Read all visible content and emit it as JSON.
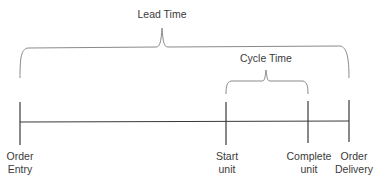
{
  "diagram": {
    "braces": [
      {
        "id": "lead-time",
        "label": "Lead Time",
        "from": "Order Entry",
        "to": "Order Delivery"
      },
      {
        "id": "cycle-time",
        "label": "Cycle Time",
        "from": "Start unit",
        "to": "Complete unit"
      }
    ],
    "milestones": [
      {
        "line1": "Order",
        "line2": "Entry"
      },
      {
        "line1": "Start",
        "line2": "unit"
      },
      {
        "line1": "Complete",
        "line2": "unit"
      },
      {
        "line1": "Order",
        "line2": "Delivery"
      }
    ],
    "colors": {
      "line": "#3a3a3a",
      "brace": "#8a8a8a",
      "text": "#3a3a3a"
    }
  }
}
